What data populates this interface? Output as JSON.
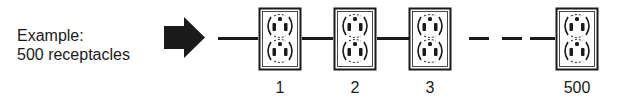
{
  "caption": {
    "line1": "Example:",
    "line2": "500 receptacles"
  },
  "icons": {
    "arrow": "right-arrow-icon",
    "receptacle": "duplex-receptacle-icon"
  },
  "receptacles": [
    {
      "label": "1"
    },
    {
      "label": "2"
    },
    {
      "label": "3"
    },
    {
      "label": "500"
    }
  ],
  "colors": {
    "ink": "#1a1a1a",
    "background": "#ffffff"
  }
}
